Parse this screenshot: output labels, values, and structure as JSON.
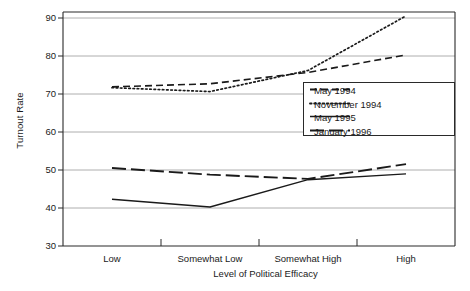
{
  "chart_data": {
    "type": "line",
    "title": "",
    "xlabel": "Level of Political Efficacy",
    "ylabel": "Turnout Rate",
    "categories": [
      "Low",
      "Somewhat Low",
      "Somewhat High",
      "High"
    ],
    "ylim": [
      30,
      90
    ],
    "yticks": [
      30,
      40,
      50,
      60,
      70,
      80,
      90
    ],
    "grid": true,
    "legend_position": "center-right",
    "series": [
      {
        "name": "May 1994",
        "style": "dashed",
        "color": "#1a1a1a",
        "values": [
          70.8,
          71.6,
          74.5,
          79.0
        ]
      },
      {
        "name": "November 1994",
        "style": "dotted",
        "color": "#1a1a1a",
        "values": [
          70.6,
          69.6,
          75.0,
          89.0
        ]
      },
      {
        "name": "May 1995",
        "style": "solid",
        "color": "#1a1a1a",
        "values": [
          42.0,
          40.0,
          47.0,
          48.5
        ]
      },
      {
        "name": "January 1996",
        "style": "long-dash",
        "color": "#1a1a1a",
        "values": [
          50.0,
          48.3,
          47.2,
          51.0
        ]
      }
    ]
  },
  "axis": {
    "y_ticks": [
      "90",
      "80",
      "70",
      "60",
      "50",
      "40",
      "30"
    ],
    "x_ticks": [
      "Low",
      "Somewhat Low",
      "Somewhat High",
      "High"
    ],
    "y_title": "Turnout Rate",
    "x_title": "Level of Political Efficacy"
  },
  "legend": {
    "items": [
      {
        "label": "May 1994",
        "style": "dashed"
      },
      {
        "label": "November 1994",
        "style": "dotted"
      },
      {
        "label": "May 1995",
        "style": "solid"
      },
      {
        "label": "January 1996",
        "style": "long-dash"
      }
    ]
  },
  "colors": {
    "line": "#1a1a1a",
    "grid": "#9a9a9a",
    "frame": "#2a2a2a",
    "background": "#ffffff"
  }
}
